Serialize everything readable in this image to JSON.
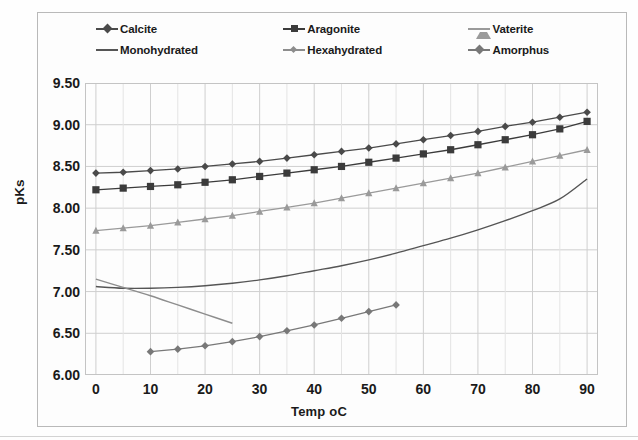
{
  "chart_data": {
    "type": "line",
    "title": "",
    "xlabel": "Temp oC",
    "ylabel": "pKs",
    "xlim": [
      -2,
      92
    ],
    "ylim": [
      6.0,
      9.5
    ],
    "xticks": [
      "0",
      "10",
      "20",
      "30",
      "40",
      "50",
      "60",
      "70",
      "80",
      "90"
    ],
    "xtick_values": [
      0,
      10,
      20,
      30,
      40,
      50,
      60,
      70,
      80,
      90
    ],
    "yticks": [
      "6.00",
      "6.50",
      "7.00",
      "7.50",
      "8.00",
      "8.50",
      "9.00",
      "9.50"
    ],
    "ytick_values": [
      6.0,
      6.5,
      7.0,
      7.5,
      8.0,
      8.5,
      9.0,
      9.5
    ],
    "grid": true,
    "legend_position": "top",
    "series": [
      {
        "name": "Calcite",
        "color": "#4a4a4a",
        "marker": "diamond",
        "x": [
          0,
          5,
          10,
          15,
          20,
          25,
          30,
          35,
          40,
          45,
          50,
          55,
          60,
          65,
          70,
          75,
          80,
          85,
          90
        ],
        "values": [
          8.42,
          8.43,
          8.45,
          8.47,
          8.5,
          8.53,
          8.56,
          8.6,
          8.64,
          8.68,
          8.72,
          8.77,
          8.82,
          8.87,
          8.92,
          8.98,
          9.03,
          9.09,
          9.15
        ]
      },
      {
        "name": "Aragonite",
        "color": "#3b3b3b",
        "marker": "square",
        "x": [
          0,
          5,
          10,
          15,
          20,
          25,
          30,
          35,
          40,
          45,
          50,
          55,
          60,
          65,
          70,
          75,
          80,
          85,
          90
        ],
        "values": [
          8.22,
          8.24,
          8.26,
          8.28,
          8.31,
          8.34,
          8.38,
          8.42,
          8.46,
          8.5,
          8.55,
          8.6,
          8.65,
          8.7,
          8.76,
          8.82,
          8.88,
          8.95,
          9.04
        ]
      },
      {
        "name": "Vaterite",
        "color": "#9a9a9a",
        "marker": "triangle",
        "x": [
          0,
          5,
          10,
          15,
          20,
          25,
          30,
          35,
          40,
          45,
          50,
          55,
          60,
          65,
          70,
          75,
          80,
          85,
          90
        ],
        "values": [
          7.73,
          7.76,
          7.79,
          7.83,
          7.87,
          7.91,
          7.96,
          8.01,
          8.06,
          8.12,
          8.18,
          8.24,
          8.3,
          8.36,
          8.42,
          8.49,
          8.56,
          8.63,
          8.7
        ]
      },
      {
        "name": "Monohydrated",
        "color": "#555555",
        "marker": "none",
        "x": [
          0,
          5,
          10,
          15,
          20,
          25,
          30,
          35,
          40,
          45,
          50,
          55,
          60,
          65,
          70,
          75,
          80,
          85,
          90
        ],
        "values": [
          7.06,
          7.04,
          7.04,
          7.05,
          7.07,
          7.1,
          7.14,
          7.19,
          7.25,
          7.31,
          7.38,
          7.46,
          7.55,
          7.64,
          7.74,
          7.85,
          7.97,
          8.11,
          8.35
        ]
      },
      {
        "name": "Hexahydrated",
        "color": "#8d8d8d",
        "marker": "none",
        "x": [
          0,
          5,
          10,
          15,
          20,
          25
        ],
        "values": [
          7.15,
          7.05,
          6.95,
          6.84,
          6.73,
          6.62
        ]
      },
      {
        "name": "Amorphus",
        "color": "#787878",
        "marker": "diamond",
        "x": [
          10,
          15,
          20,
          25,
          30,
          35,
          40,
          45,
          50,
          55
        ],
        "values": [
          6.28,
          6.31,
          6.35,
          6.4,
          6.46,
          6.53,
          6.6,
          6.68,
          6.76,
          6.84
        ]
      }
    ]
  },
  "legend": {
    "items": [
      {
        "label": "Calcite"
      },
      {
        "label": "Aragonite"
      },
      {
        "label": "Vaterite"
      },
      {
        "label": "Monohydrated"
      },
      {
        "label": "Hexahydrated"
      },
      {
        "label": "Amorphus"
      }
    ]
  }
}
